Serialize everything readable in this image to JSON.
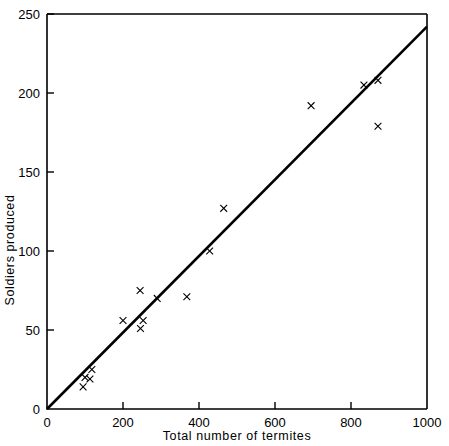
{
  "chart_data": {
    "type": "scatter",
    "title": "",
    "xlabel": "Total number of termites",
    "ylabel": "Soldiers produced",
    "xlim": [
      0,
      1000
    ],
    "ylim": [
      0,
      250
    ],
    "xticks": [
      0,
      200,
      400,
      600,
      800,
      1000
    ],
    "yticks": [
      0,
      50,
      100,
      150,
      200,
      250
    ],
    "xtick_labels": [
      "0",
      "200",
      "400",
      "600",
      "800",
      "1000"
    ],
    "ytick_labels": [
      "0",
      "50",
      "100",
      "150",
      "200",
      "250"
    ],
    "grid": false,
    "legend": null,
    "marker_symbol": "x",
    "marker_color": "#000000",
    "series": [
      {
        "name": "Colonies",
        "points": [
          {
            "x": 95,
            "y": 14
          },
          {
            "x": 100,
            "y": 20
          },
          {
            "x": 113,
            "y": 19
          },
          {
            "x": 118,
            "y": 25
          },
          {
            "x": 200,
            "y": 56
          },
          {
            "x": 245,
            "y": 75
          },
          {
            "x": 246,
            "y": 51
          },
          {
            "x": 253,
            "y": 56
          },
          {
            "x": 290,
            "y": 70
          },
          {
            "x": 368,
            "y": 71
          },
          {
            "x": 428,
            "y": 100
          },
          {
            "x": 465,
            "y": 127
          },
          {
            "x": 695,
            "y": 192
          },
          {
            "x": 834,
            "y": 205
          },
          {
            "x": 871,
            "y": 208
          },
          {
            "x": 871,
            "y": 179
          }
        ]
      }
    ],
    "fit_line": {
      "name": "regression line through origin",
      "x0": 0,
      "y0": 0,
      "x1": 1000,
      "y1": 242,
      "slope": 0.242
    }
  },
  "axes": {
    "y_title": "Soldiers produced",
    "x_title": "Total number of termites"
  }
}
